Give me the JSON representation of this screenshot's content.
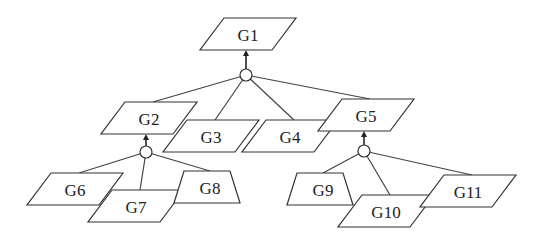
{
  "diagram": {
    "type": "goal-tree",
    "nodes": [
      {
        "id": "G1",
        "label": "G1",
        "shape": "parallelogram",
        "cx": 248,
        "cy": 34
      },
      {
        "id": "G2",
        "label": "G2",
        "shape": "parallelogram",
        "cx": 149,
        "cy": 118
      },
      {
        "id": "G3",
        "label": "G3",
        "shape": "parallelogram",
        "cx": 211,
        "cy": 136
      },
      {
        "id": "G4",
        "label": "G4",
        "shape": "parallelogram",
        "cx": 290,
        "cy": 136
      },
      {
        "id": "G5",
        "label": "G5",
        "shape": "parallelogram",
        "cx": 366,
        "cy": 115
      },
      {
        "id": "G6",
        "label": "G6",
        "shape": "parallelogram",
        "cx": 75,
        "cy": 189
      },
      {
        "id": "G7",
        "label": "G7",
        "shape": "parallelogram",
        "cx": 136,
        "cy": 206
      },
      {
        "id": "G8",
        "label": "G8",
        "shape": "trapezoid",
        "cx": 210,
        "cy": 187
      },
      {
        "id": "G9",
        "label": "G9",
        "shape": "trapezoid",
        "cx": 323,
        "cy": 189
      },
      {
        "id": "G10",
        "label": "G10",
        "shape": "parallelogram",
        "cx": 386,
        "cy": 211
      },
      {
        "id": "G11",
        "label": "G11",
        "shape": "parallelogram",
        "cx": 468,
        "cy": 191
      }
    ],
    "junctions": [
      {
        "id": "J1",
        "parent": "G1",
        "children": [
          "G2",
          "G3",
          "G4",
          "G5"
        ],
        "cx": 246,
        "cy": 75
      },
      {
        "id": "J2",
        "parent": "G2",
        "children": [
          "G6",
          "G7",
          "G8"
        ],
        "cx": 146,
        "cy": 152
      },
      {
        "id": "J3",
        "parent": "G5",
        "children": [
          "G9",
          "G10",
          "G11"
        ],
        "cx": 364,
        "cy": 151
      }
    ]
  }
}
